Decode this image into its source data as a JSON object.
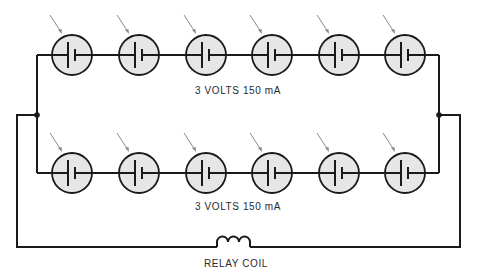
{
  "diagram": {
    "type": "circuit-schematic",
    "colors": {
      "wire": "#1a1a1a",
      "cell_fill": "#e6e6e6",
      "light_arrow": "#8a8a8a",
      "background": "#ffffff"
    },
    "top_string": {
      "label": "3 VOLTS 150 mA",
      "cell_count": 6,
      "cells_x": [
        72,
        139,
        206,
        272,
        339,
        405
      ],
      "wire_y": 55
    },
    "bottom_string": {
      "label": "3 VOLTS 150 mA",
      "cell_count": 6,
      "cells_x": [
        72,
        139,
        206,
        272,
        339,
        405
      ],
      "wire_y": 173
    },
    "load": {
      "label": "RELAY COIL",
      "symbol": "inductor-coil"
    },
    "junctions": [
      {
        "x": 37,
        "y": 115
      },
      {
        "x": 439,
        "y": 115
      }
    ]
  }
}
